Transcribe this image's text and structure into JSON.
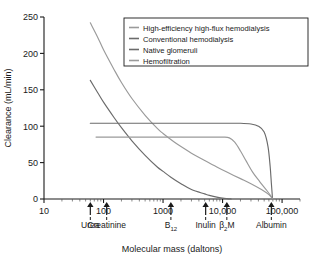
{
  "chart_data": {
    "type": "line",
    "title": "",
    "xlabel": "Molecular mass (daltons)",
    "ylabel": "Clearance (mL/min)",
    "xscale": "log",
    "xlim": [
      10,
      200000
    ],
    "ylim": [
      0,
      250
    ],
    "xticks": [
      10,
      100,
      1000,
      10000,
      100000
    ],
    "xtick_labels": [
      "10",
      "100",
      "1000",
      "10,000",
      "100,000"
    ],
    "yticks": [
      0,
      50,
      100,
      150,
      200,
      250
    ],
    "ytick_labels": [
      "0",
      "50",
      "100",
      "150",
      "200",
      "250"
    ],
    "grid": false,
    "legend_position": "upper right",
    "series": [
      {
        "name": "High-efficiency high-flux hemodialysis",
        "color": "#9a9a9a",
        "points": [
          [
            60,
            242
          ],
          [
            80,
            222
          ],
          [
            100,
            205
          ],
          [
            150,
            178
          ],
          [
            200,
            160
          ],
          [
            300,
            138
          ],
          [
            500,
            115
          ],
          [
            800,
            97
          ],
          [
            1000,
            90
          ],
          [
            1500,
            79
          ],
          [
            2000,
            72
          ],
          [
            3000,
            63
          ],
          [
            5000,
            53
          ],
          [
            8000,
            44
          ],
          [
            11800,
            37
          ],
          [
            20000,
            28
          ],
          [
            30000,
            21
          ],
          [
            45000,
            13
          ],
          [
            60000,
            6
          ],
          [
            70000,
            0
          ]
        ]
      },
      {
        "name": "Conventional hemodialysis",
        "color": "#6b6b6b",
        "points": [
          [
            60,
            163
          ],
          [
            80,
            146
          ],
          [
            100,
            133
          ],
          [
            150,
            112
          ],
          [
            200,
            98
          ],
          [
            300,
            80
          ],
          [
            500,
            60
          ],
          [
            800,
            44
          ],
          [
            1000,
            38
          ],
          [
            1355,
            30
          ],
          [
            2000,
            21
          ],
          [
            3000,
            13
          ],
          [
            5000,
            7
          ],
          [
            6000,
            5
          ],
          [
            8000,
            2.5
          ],
          [
            10000,
            1.2
          ],
          [
            12000,
            0.5
          ],
          [
            14000,
            0
          ]
        ]
      },
      {
        "name": "Native glomeruli",
        "color": "#6b6b6b",
        "points": [
          [
            60,
            104
          ],
          [
            100,
            104
          ],
          [
            1000,
            104
          ],
          [
            5000,
            104
          ],
          [
            11800,
            104
          ],
          [
            20000,
            104
          ],
          [
            30000,
            103
          ],
          [
            40000,
            100
          ],
          [
            50000,
            92
          ],
          [
            58000,
            72
          ],
          [
            63000,
            45
          ],
          [
            66000,
            22
          ],
          [
            68000,
            8
          ],
          [
            69000,
            0
          ]
        ]
      },
      {
        "name": "Hemofiltration",
        "color": "#9a9a9a",
        "points": [
          [
            75,
            85
          ],
          [
            100,
            85
          ],
          [
            1000,
            85
          ],
          [
            5000,
            85
          ],
          [
            10000,
            85
          ],
          [
            13000,
            84
          ],
          [
            16000,
            78
          ],
          [
            20000,
            66
          ],
          [
            25000,
            52
          ],
          [
            32000,
            37
          ],
          [
            42000,
            24
          ],
          [
            55000,
            12
          ],
          [
            65000,
            4
          ],
          [
            70000,
            0
          ]
        ]
      }
    ],
    "markers": [
      {
        "label": "Urea",
        "mass": 60
      },
      {
        "label": "Creatinine",
        "mass": 113
      },
      {
        "label": "B",
        "sub": "12",
        "mass": 1355
      },
      {
        "label": "Inulin",
        "mass": 5200
      },
      {
        "label": "β",
        "sub": "2",
        "label2": "M",
        "mass": 11800
      },
      {
        "label": "Albumin",
        "mass": 66000
      }
    ]
  },
  "axes": {
    "ylabel": "Clearance (mL/min)",
    "xlabel": "Molecular mass (daltons)"
  },
  "legend": {
    "items": [
      {
        "label": "High-efficiency high-flux hemodialysis"
      },
      {
        "label": "Conventional hemodialysis"
      },
      {
        "label": "Native glomeruli"
      },
      {
        "label": "Hemofiltration"
      }
    ]
  }
}
